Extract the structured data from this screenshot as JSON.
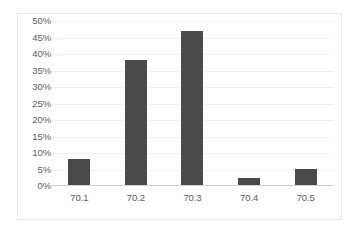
{
  "chart_data": {
    "type": "bar",
    "title": "",
    "subtitle": "",
    "xlabel": "",
    "ylabel": "",
    "categories": [
      "70.1",
      "70.2",
      "70.3",
      "70.4",
      "70.5"
    ],
    "values": [
      8,
      38,
      47,
      2,
      5
    ],
    "value_unit": "%",
    "ylim": [
      0,
      50
    ],
    "ytick_step": 5,
    "ytick_labels": [
      "50%",
      "45%",
      "40%",
      "35%",
      "30%",
      "25%",
      "20%",
      "15%",
      "10%",
      "5%",
      "0%"
    ],
    "ytick_values": [
      50,
      45,
      40,
      35,
      30,
      25,
      20,
      15,
      10,
      5,
      0
    ],
    "series": [
      {
        "name": "",
        "values": [
          8,
          38,
          47,
          2,
          5
        ]
      }
    ],
    "grid": true,
    "grid_axis": "y",
    "legend": false,
    "legend_position": "none",
    "annotations": [],
    "colors": {
      "bar": "#4a4a4a",
      "gridline": "#efefef",
      "axis_line": "#d2d2d2",
      "tick_label": "#5d5d5d",
      "plot_background": "#ffffff",
      "border": "#e8e8e8"
    }
  }
}
